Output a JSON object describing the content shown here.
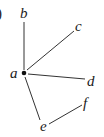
{
  "figure": {
    "partial_label": ")",
    "nodes": [
      {
        "id": "a",
        "label": "a",
        "x": 24,
        "y": 73,
        "label_x": 14,
        "label_y": 78,
        "has_dot": true
      },
      {
        "id": "b",
        "label": "b",
        "x": 24,
        "y": 22,
        "label_x": 24,
        "label_y": 18
      },
      {
        "id": "c",
        "label": "c",
        "x": 74,
        "y": 31,
        "label_x": 79,
        "label_y": 31
      },
      {
        "id": "d",
        "label": "d",
        "x": 85,
        "y": 79,
        "label_x": 91,
        "label_y": 86
      },
      {
        "id": "f",
        "label": "f",
        "x": 82,
        "y": 105,
        "label_x": 86,
        "label_y": 107
      },
      {
        "id": "e",
        "label": "e",
        "x": 43,
        "y": 121,
        "label_x": 43,
        "label_y": 131
      }
    ],
    "edges": [
      {
        "from": "a",
        "to": "b",
        "x1": 24,
        "y1": 70,
        "x2": 24,
        "y2": 22
      },
      {
        "from": "a",
        "to": "c",
        "x1": 27,
        "y1": 70,
        "x2": 74,
        "y2": 31
      },
      {
        "from": "a",
        "to": "d",
        "x1": 28,
        "y1": 74,
        "x2": 85,
        "y2": 79
      },
      {
        "from": "a",
        "to": "e",
        "x1": 25,
        "y1": 77,
        "x2": 40,
        "y2": 120
      },
      {
        "from": "e",
        "to": "f",
        "x1": 49,
        "y1": 124,
        "x2": 82,
        "y2": 105
      }
    ],
    "colors": {
      "ink": "#1a1a1a",
      "edge": "#333333",
      "background": "#ffffff"
    }
  }
}
